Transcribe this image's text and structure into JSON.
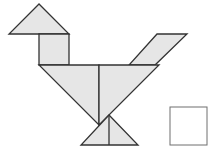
{
  "diagram": {
    "colors": {
      "fill": "#e6e6e6",
      "stroke": "#333333",
      "answer_box_stroke": "#6f6f6f",
      "background": "#ffffff"
    },
    "pieces": [
      {
        "name": "head-triangle",
        "points": "39,4 9,34 69,34"
      },
      {
        "name": "neck-square",
        "points": "39,34 69,34 69,65 39,65"
      },
      {
        "name": "tail-parallelogram",
        "points": "157,34 187,34 155,65 129,65"
      },
      {
        "name": "body-left-triangle",
        "points": "39,65 99,65 99,125"
      },
      {
        "name": "body-right-triangle",
        "points": "99,65 159,65 99,125"
      },
      {
        "name": "feet-triangle",
        "points": "109,115 138,145 81,145"
      }
    ],
    "feet_divider": {
      "x1": 109,
      "y1": 115,
      "x2": 109,
      "y2": 145
    },
    "answer_box": {
      "x": 170,
      "y": 107,
      "width": 37,
      "height": 38
    }
  }
}
